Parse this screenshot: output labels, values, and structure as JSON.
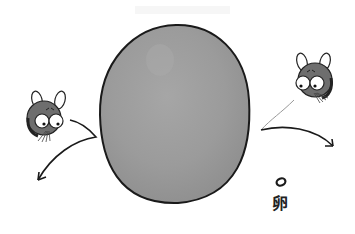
{
  "illustration": {
    "description": "Hand-drawn illustration of a large gray egg-shaped oval with two small rabbit-like characters on either side, each with a curved arrow, and a small ring with a label below on the right",
    "oval": {
      "fill": "#9a9a9a",
      "stroke": "#1a1a1a"
    },
    "characters": [
      {
        "name": "left-rabbit",
        "position": "left"
      },
      {
        "name": "right-rabbit",
        "position": "right"
      }
    ],
    "arrows": [
      {
        "name": "left-curved-arrow",
        "direction": "down-left"
      },
      {
        "name": "right-curved-arrow",
        "direction": "down-right"
      }
    ],
    "symbol": {
      "shape": "ring"
    },
    "label": "卵"
  }
}
